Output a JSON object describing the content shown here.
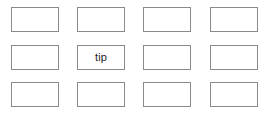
{
  "canvas": {
    "width": 274,
    "height": 115,
    "background_color": "#ffffff"
  },
  "grid": {
    "columns": 4,
    "rows": 3,
    "cell_width": 48,
    "cell_height": 25,
    "column_x": [
      11,
      77,
      143,
      210
    ],
    "row_y": [
      7,
      45,
      82
    ],
    "border_color": "#8a8a8a",
    "cell_fill_color": "#ffffff",
    "text_color": "#1a1a1a"
  },
  "cells": [
    {
      "id": "r1c1",
      "row": 1,
      "column": 1,
      "label": ""
    },
    {
      "id": "r1c2",
      "row": 1,
      "column": 2,
      "label": ""
    },
    {
      "id": "r1c3",
      "row": 1,
      "column": 3,
      "label": ""
    },
    {
      "id": "r1c4",
      "row": 1,
      "column": 4,
      "label": ""
    },
    {
      "id": "r2c1",
      "row": 2,
      "column": 1,
      "label": ""
    },
    {
      "id": "r2c2",
      "row": 2,
      "column": 2,
      "label": "tip"
    },
    {
      "id": "r2c3",
      "row": 2,
      "column": 3,
      "label": ""
    },
    {
      "id": "r2c4",
      "row": 2,
      "column": 4,
      "label": ""
    },
    {
      "id": "r3c1",
      "row": 3,
      "column": 1,
      "label": ""
    },
    {
      "id": "r3c2",
      "row": 3,
      "column": 2,
      "label": ""
    },
    {
      "id": "r3c3",
      "row": 3,
      "column": 3,
      "label": ""
    },
    {
      "id": "r3c4",
      "row": 3,
      "column": 4,
      "label": ""
    }
  ]
}
